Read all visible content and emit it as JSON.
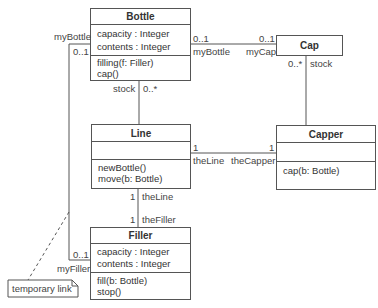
{
  "diagram": {
    "type": "UML class diagram",
    "classes": {
      "bottle": {
        "name": "Bottle",
        "attributes": [
          "capacity : Integer",
          "contents : Integer"
        ],
        "operations": [
          "filling(f: Filler)",
          "cap()"
        ]
      },
      "cap": {
        "name": "Cap",
        "attributes": [],
        "operations": []
      },
      "line": {
        "name": "Line",
        "attributes": [],
        "operations": [
          "newBottle()",
          "move(b: Bottle)"
        ]
      },
      "capper": {
        "name": "Capper",
        "attributes": [],
        "operations": [
          "cap(b: Bottle)"
        ]
      },
      "filler": {
        "name": "Filler",
        "attributes": [
          "capacity : Integer",
          "contents : Integer"
        ],
        "operations": [
          "fill(b: Bottle)",
          "stop()"
        ]
      }
    },
    "associations": {
      "bottle_cap": {
        "bottle_end_mult": "0..1",
        "bottle_end_role": "myBottle",
        "cap_end_mult": "0..1",
        "cap_end_role": "myCap"
      },
      "bottle_line": {
        "bottle_end_role": "stock",
        "bottle_end_mult": "0..*"
      },
      "cap_capper": {
        "cap_end_mult": "0..*",
        "cap_end_role": "stock"
      },
      "line_capper": {
        "line_end_mult": "1",
        "line_end_role": "theLine",
        "capper_end_mult": "1",
        "capper_end_role": "theCapper"
      },
      "line_filler": {
        "line_end_mult": "1",
        "line_end_role": "theLine",
        "filler_end_mult": "1",
        "filler_end_role": "theFiller"
      },
      "bottle_filler": {
        "bottle_end_role": "myBottle",
        "bottle_end_mult": "0..1",
        "filler_end_mult": "0..1",
        "filler_end_role": "myFiller"
      }
    },
    "note": {
      "text": "temporary link"
    }
  }
}
